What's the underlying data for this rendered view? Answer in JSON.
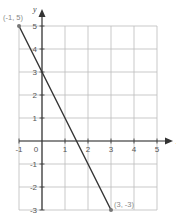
{
  "chart_data": {
    "type": "line",
    "title": "",
    "xlabel": "x",
    "ylabel": "y",
    "xlim": [
      -1,
      5
    ],
    "ylim": [
      -3,
      5
    ],
    "grid": true,
    "x_ticks": [
      "-1",
      "0",
      "1",
      "2",
      "3",
      "4",
      "5"
    ],
    "y_ticks": [
      "5",
      "4",
      "3",
      "2",
      "1",
      "-1",
      "-2",
      "-3"
    ],
    "series": [
      {
        "name": "line",
        "points": [
          [
            -1,
            5
          ],
          [
            3,
            -3
          ]
        ]
      }
    ],
    "annotations": [
      {
        "text": "(-1, 5)",
        "x": -1,
        "y": 5
      },
      {
        "text": "(3, -3)",
        "x": 3,
        "y": -3
      }
    ],
    "colors": {
      "line": "#333333",
      "grid": "#bbbbbb",
      "axis": "#333333",
      "label": "#888888"
    }
  }
}
